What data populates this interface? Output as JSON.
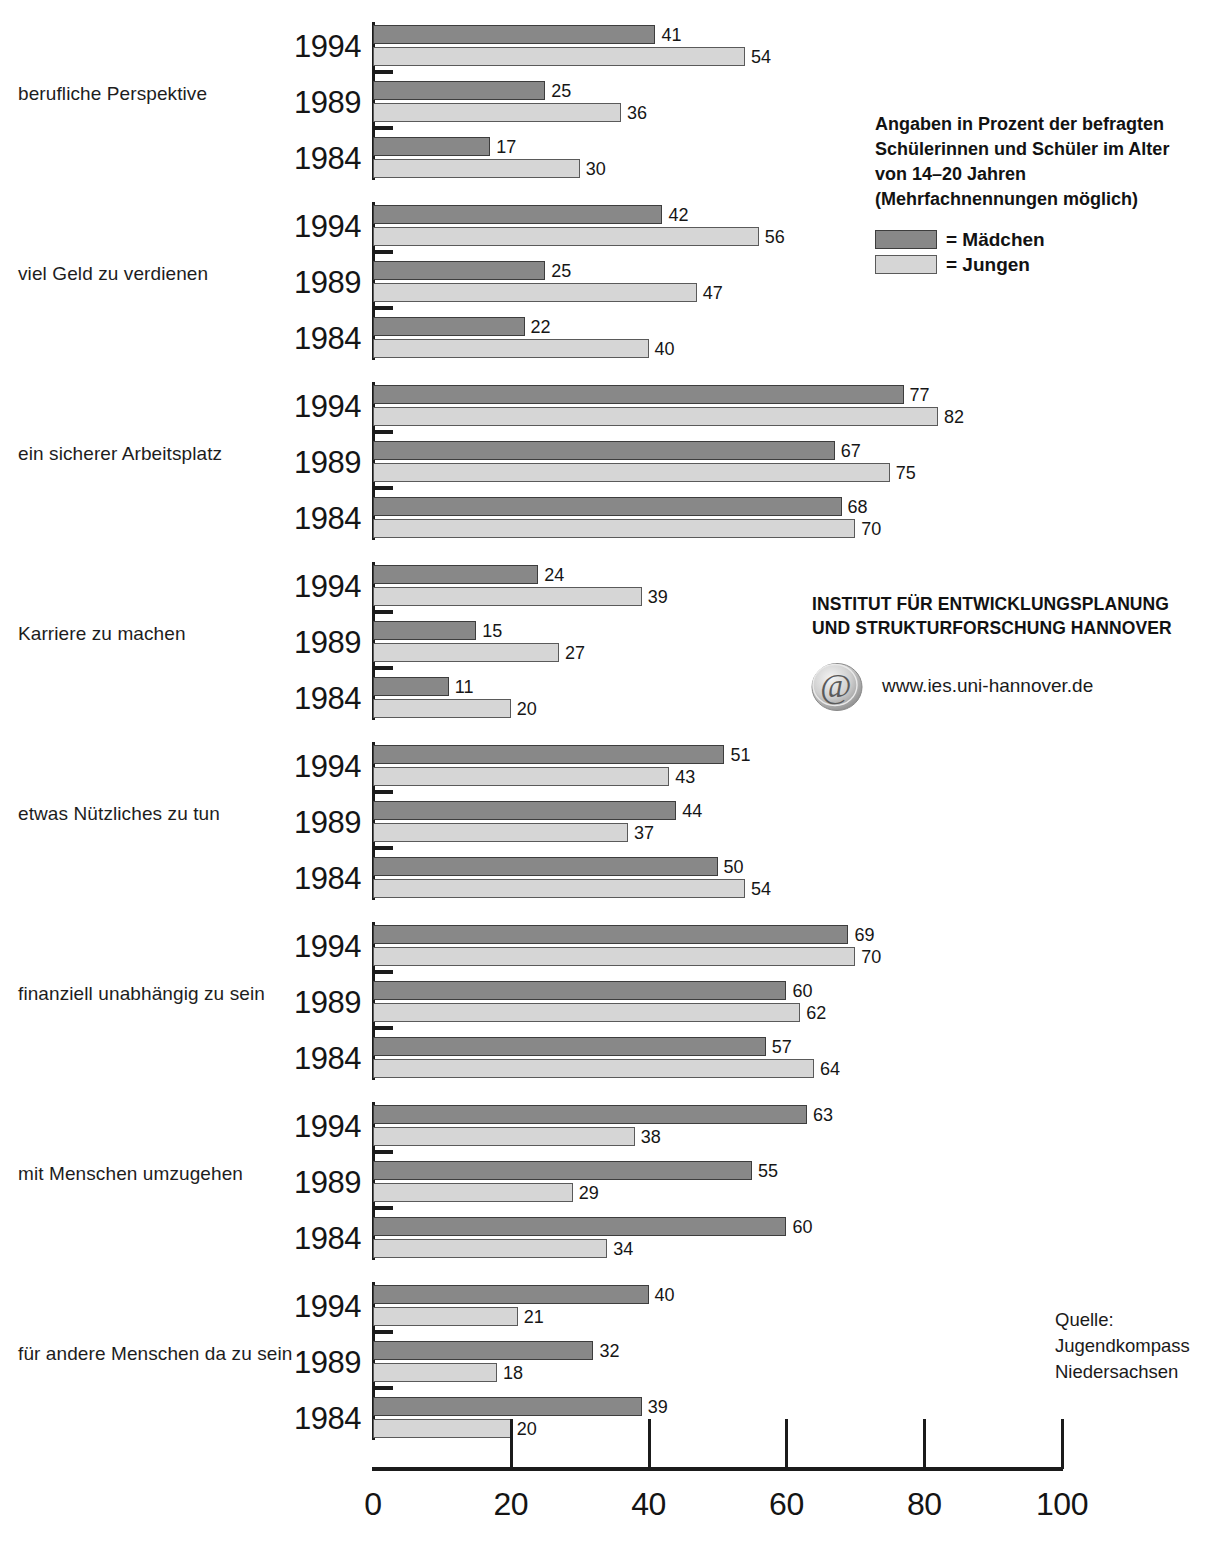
{
  "chart_data": {
    "type": "bar",
    "orientation": "horizontal",
    "title": "",
    "xlabel": "",
    "ylabel": "",
    "xlim": [
      0,
      100
    ],
    "xticks": [
      0,
      20,
      40,
      60,
      80,
      100
    ],
    "grid": false,
    "legend_position": "top-right",
    "series_names": [
      "Mädchen",
      "Jungen"
    ],
    "series_colors": {
      "Mädchen": "#888888",
      "Jungen": "#d6d6d6"
    },
    "years": [
      "1994",
      "1989",
      "1984"
    ],
    "groups": [
      {
        "category": "berufliche Perspektive",
        "rows": [
          {
            "year": "1994",
            "maedchen": 41,
            "jungen": 54
          },
          {
            "year": "1989",
            "maedchen": 25,
            "jungen": 36
          },
          {
            "year": "1984",
            "maedchen": 17,
            "jungen": 30
          }
        ]
      },
      {
        "category": "viel Geld zu verdienen",
        "rows": [
          {
            "year": "1994",
            "maedchen": 42,
            "jungen": 56
          },
          {
            "year": "1989",
            "maedchen": 25,
            "jungen": 47
          },
          {
            "year": "1984",
            "maedchen": 22,
            "jungen": 40
          }
        ]
      },
      {
        "category": "ein sicherer Arbeitsplatz",
        "rows": [
          {
            "year": "1994",
            "maedchen": 77,
            "jungen": 82
          },
          {
            "year": "1989",
            "maedchen": 67,
            "jungen": 75
          },
          {
            "year": "1984",
            "maedchen": 68,
            "jungen": 70
          }
        ]
      },
      {
        "category": "Karriere zu machen",
        "rows": [
          {
            "year": "1994",
            "maedchen": 24,
            "jungen": 39
          },
          {
            "year": "1989",
            "maedchen": 15,
            "jungen": 27
          },
          {
            "year": "1984",
            "maedchen": 11,
            "jungen": 20
          }
        ]
      },
      {
        "category": "etwas Nützliches zu tun",
        "rows": [
          {
            "year": "1994",
            "maedchen": 51,
            "jungen": 43
          },
          {
            "year": "1989",
            "maedchen": 44,
            "jungen": 37
          },
          {
            "year": "1984",
            "maedchen": 50,
            "jungen": 54
          }
        ]
      },
      {
        "category": "finanziell unabhängig  zu sein",
        "rows": [
          {
            "year": "1994",
            "maedchen": 69,
            "jungen": 70
          },
          {
            "year": "1989",
            "maedchen": 60,
            "jungen": 62
          },
          {
            "year": "1984",
            "maedchen": 57,
            "jungen": 64
          }
        ]
      },
      {
        "category": "mit Menschen umzugehen",
        "rows": [
          {
            "year": "1994",
            "maedchen": 63,
            "jungen": 38
          },
          {
            "year": "1989",
            "maedchen": 55,
            "jungen": 29
          },
          {
            "year": "1984",
            "maedchen": 60,
            "jungen": 34
          }
        ]
      },
      {
        "category": "für andere Menschen da zu sein",
        "rows": [
          {
            "year": "1994",
            "maedchen": 40,
            "jungen": 21
          },
          {
            "year": "1989",
            "maedchen": 32,
            "jungen": 18
          },
          {
            "year": "1984",
            "maedchen": 39,
            "jungen": 20
          }
        ]
      }
    ]
  },
  "note": {
    "line1": "Angaben in Prozent der befragten",
    "line2": "Schülerinnen und Schüler im Alter",
    "line3": "von 14–20 Jahren",
    "line4": "(Mehrfachnennungen möglich)"
  },
  "legend": {
    "maedchen_label": "= Mädchen",
    "jungen_label": "= Jungen"
  },
  "institute": {
    "line1": "INSTITUT FÜR ENTWICKLUNGSPLANUNG",
    "line2": "UND STRUKTURFORSCHUNG HANNOVER",
    "website": "www.ies.uni-hannover.de",
    "icon": "at-sign-icon"
  },
  "source": {
    "line1": "Quelle:",
    "line2": "Jugendkompass",
    "line3": "Niedersachsen"
  },
  "axis": {
    "ticks": [
      "0",
      "20",
      "40",
      "60",
      "80",
      "100"
    ]
  }
}
